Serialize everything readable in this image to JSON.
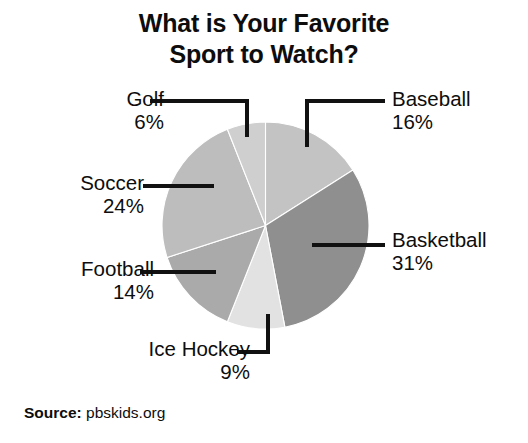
{
  "chart_data": {
    "type": "pie",
    "title": "What is Your Favorite Sport to Watch?",
    "title_line1": "What is Your Favorite",
    "title_line2": "Sport to Watch?",
    "xlabel": "",
    "ylabel": "",
    "legend": "none",
    "grid": false,
    "start_angle_deg": 0,
    "direction": "clockwise",
    "units": "percent",
    "total": 100,
    "categories": [
      "Baseball",
      "Basketball",
      "Ice Hockey",
      "Football",
      "Soccer",
      "Golf"
    ],
    "values": [
      16,
      31,
      9,
      14,
      24,
      6
    ],
    "slices": [
      {
        "label": "Baseball",
        "value": 16,
        "value_text": "16%",
        "color": "#c3c3c3",
        "start_deg": 0,
        "end_deg": 57.6
      },
      {
        "label": "Basketball",
        "value": 31,
        "value_text": "31%",
        "color": "#8f8f8f",
        "start_deg": 57.6,
        "end_deg": 169.2
      },
      {
        "label": "Ice Hockey",
        "value": 9,
        "value_text": "9%",
        "color": "#e2e2e2",
        "start_deg": 169.2,
        "end_deg": 201.6
      },
      {
        "label": "Football",
        "value": 14,
        "value_text": "14%",
        "color": "#aaaaaa",
        "start_deg": 201.6,
        "end_deg": 252.0
      },
      {
        "label": "Soccer",
        "value": 24,
        "value_text": "24%",
        "color": "#bdbdbd",
        "start_deg": 252.0,
        "end_deg": 338.4
      },
      {
        "label": "Golf",
        "value": 6,
        "value_text": "6%",
        "color": "#cfcfcf",
        "start_deg": 338.4,
        "end_deg": 360.0
      }
    ]
  },
  "title": {
    "line1": "What is Your Favorite",
    "line2": "Sport to Watch?"
  },
  "labels": {
    "golf": {
      "name": "Golf",
      "pct": "6%"
    },
    "soccer": {
      "name": "Soccer",
      "pct": "24%"
    },
    "football": {
      "name": "Football",
      "pct": "14%"
    },
    "ice_hockey": {
      "name": "Ice Hockey",
      "pct": "9%"
    },
    "baseball": {
      "name": "Baseball",
      "pct": "16%"
    },
    "basketball": {
      "name": "Basketball",
      "pct": "31%"
    }
  },
  "source": {
    "key": "Source:",
    "value": "pbskids.org"
  },
  "colors": {
    "background": "#ffffff",
    "text": "#0d0d0d",
    "leader_line": "#111111"
  }
}
